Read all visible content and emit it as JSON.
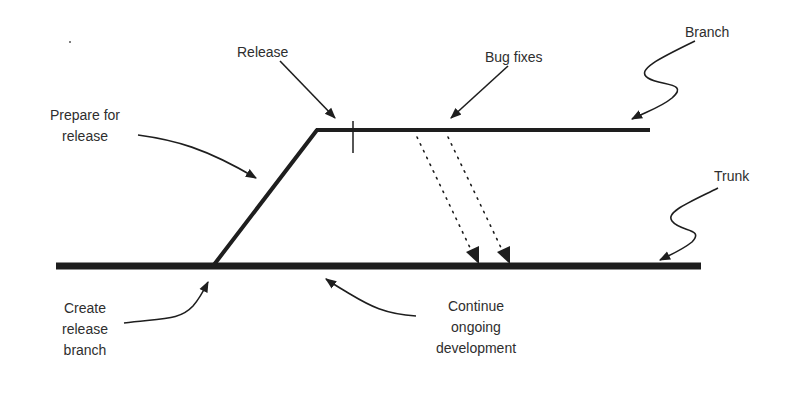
{
  "diagram": {
    "type": "release-branching-timeline",
    "lines": {
      "trunk": {
        "name": "Trunk",
        "x1": 56,
        "y1": 266,
        "x2": 701,
        "y2": 266,
        "stroke_width": 7
      },
      "branch_diagonal": {
        "x1": 213,
        "y1": 266,
        "x2": 317,
        "y2": 130,
        "stroke_width": 4
      },
      "branch_horizontal": {
        "name": "Branch",
        "x1": 317,
        "y1": 130,
        "x2": 650,
        "y2": 130,
        "stroke_width": 4
      },
      "release_tick": {
        "x": 353,
        "y1": 122,
        "y2": 153
      },
      "merge_arrows": [
        {
          "x1": 417,
          "y1": 136,
          "x2": 477,
          "y2": 263
        },
        {
          "x1": 448,
          "y1": 136,
          "x2": 508,
          "y2": 263
        }
      ]
    },
    "colors": {
      "line": "#1e1e1e",
      "text": "#2e2e2e",
      "background": "#ffffff"
    }
  },
  "labels": {
    "release": "Release",
    "bug_fixes": "Bug fixes",
    "branch": "Branch",
    "trunk": "Trunk",
    "prepare_for_release": [
      "Prepare for",
      "release"
    ],
    "create_release_branch": [
      "Create",
      "release",
      "branch"
    ],
    "continue_ongoing_development": [
      "Continue",
      "ongoing",
      "development"
    ]
  }
}
